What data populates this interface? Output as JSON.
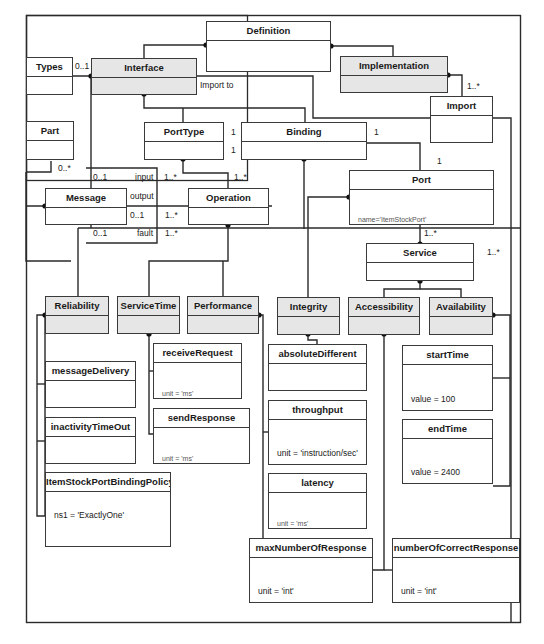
{
  "classes": {
    "definition": {
      "name": "Definition",
      "attr": ""
    },
    "types": {
      "name": "Types",
      "attr": ""
    },
    "interface": {
      "name": "Interface",
      "attr": ""
    },
    "implementation": {
      "name": "Implementation",
      "attr": ""
    },
    "import": {
      "name": "Import",
      "attr": ""
    },
    "part": {
      "name": "Part",
      "attr": ""
    },
    "porttype": {
      "name": "PortType",
      "attr": ""
    },
    "binding": {
      "name": "Binding",
      "attr": ""
    },
    "message": {
      "name": "Message",
      "attr": ""
    },
    "operation": {
      "name": "Operation",
      "attr": ""
    },
    "port": {
      "name": "Port",
      "attr": "name='ItemStockPort'"
    },
    "service": {
      "name": "Service",
      "attr": ""
    },
    "reliability": {
      "name": "Reliability",
      "attr": ""
    },
    "servicetime": {
      "name": "ServiceTime",
      "attr": ""
    },
    "performance": {
      "name": "Performance",
      "attr": ""
    },
    "integrity": {
      "name": "Integrity",
      "attr": ""
    },
    "accessibility": {
      "name": "Accessibility",
      "attr": ""
    },
    "availability": {
      "name": "Availability",
      "attr": ""
    },
    "messagedelivery": {
      "name": "messageDelivery",
      "attr": ""
    },
    "inactivitytimeout": {
      "name": "inactivityTimeOut",
      "attr": ""
    },
    "policy": {
      "name": "ItemStockPortBindingPolicy",
      "attr": "ns1 = 'ExactlyOne'"
    },
    "receiverequest": {
      "name": "receiveRequest",
      "attr": "unit = 'ms'"
    },
    "sendresponse": {
      "name": "sendResponse",
      "attr": "unit = 'ms'"
    },
    "absolutedifferent": {
      "name": "absoluteDifferent",
      "attr": ""
    },
    "throughput": {
      "name": "throughput",
      "attr": "unit = 'instruction/sec'"
    },
    "latency": {
      "name": "latency",
      "attr": "unit = 'ms'"
    },
    "starttime": {
      "name": "startTime",
      "attr": "value = 100"
    },
    "endtime": {
      "name": "endTime",
      "attr": "value = 2400"
    },
    "maxnumberofresponse": {
      "name": "maxNumberOfResponse",
      "attr": "unit = 'int'"
    },
    "numberofcorrectresponse": {
      "name": "numberOfCorrectResponse",
      "attr": "unit = 'int'"
    }
  },
  "labels": {
    "types_mult": "0..1",
    "import_to": "Import to",
    "import_mult": "1..*",
    "part_mult": "0..*",
    "porttype_1a": "1",
    "porttype_1b": "1",
    "binding_1": "1",
    "port_1": "1",
    "input_mult": "0..1",
    "input": "input",
    "input_op": "1..*",
    "op_mult": "1..*",
    "output": "output",
    "output_mult": "0..1",
    "output_op": "1..*",
    "fault_mult": "0..1",
    "fault": "fault",
    "fault_op": "1..*",
    "service_mult": "1..*",
    "service_right": "1..*"
  }
}
